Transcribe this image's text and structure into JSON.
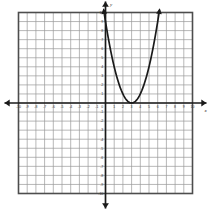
{
  "chart_data": {
    "type": "line",
    "title": "",
    "subtitle": "",
    "xlabel": "x",
    "ylabel": "y",
    "xlim": [
      -10,
      10
    ],
    "ylim": [
      -10,
      10
    ],
    "grid": true,
    "legend": "none",
    "x_ticks": [
      -10,
      -9,
      -8,
      -7,
      -6,
      -5,
      -4,
      -3,
      -2,
      -1,
      1,
      2,
      3,
      4,
      5,
      6,
      7,
      8,
      9,
      10
    ],
    "y_ticks": [
      10,
      9,
      8,
      7,
      6,
      5,
      4,
      3,
      2,
      1,
      -1,
      -2,
      -3,
      -4,
      -5,
      -6,
      -7,
      -8,
      -9,
      -10
    ],
    "x_tick_labels": [
      "-10",
      "-9",
      "-8",
      "-7",
      "-6",
      "-5",
      "-4",
      "-3",
      "-2",
      "-1",
      "1",
      "2",
      "3",
      "4",
      "5",
      "6",
      "7",
      "8",
      "9",
      "10"
    ],
    "y_tick_labels": [
      "10",
      "9",
      "8",
      "7",
      "6",
      "5",
      "4",
      "3",
      "2",
      "1",
      "-1",
      "-2",
      "-3",
      "-4",
      "-5",
      "-6",
      "-7",
      "-8",
      "-9",
      "-10"
    ],
    "origin_label": "0",
    "series": [
      {
        "name": "parabola",
        "equation": "y = (x - 3)^2",
        "vertex": [
          3,
          0
        ],
        "opens": "up",
        "color": "#1a1a1a",
        "x": [
          -0.2,
          0.0,
          0.5,
          1.0,
          1.5,
          2.0,
          2.5,
          3.0,
          3.5,
          4.0,
          4.5,
          5.0,
          5.5,
          6.0,
          6.2
        ],
        "values": [
          10.24,
          9.0,
          6.25,
          4.0,
          2.25,
          1.0,
          0.25,
          0.0,
          0.25,
          1.0,
          2.25,
          4.0,
          6.25,
          9.0,
          10.24
        ]
      }
    ],
    "annotations": [
      {
        "name": "y-axis-arrow-up",
        "at": [
          0,
          10.6
        ]
      },
      {
        "name": "y-axis-arrow-down",
        "at": [
          0,
          -11.2
        ]
      },
      {
        "name": "x-axis-arrow-right",
        "at": [
          11.2,
          0
        ]
      },
      {
        "name": "x-axis-arrow-left",
        "at": [
          -11.2,
          0
        ]
      },
      {
        "name": "curve-arrow-left-end",
        "at": [
          -0.2,
          10.4
        ]
      },
      {
        "name": "curve-arrow-right-end",
        "at": [
          6.2,
          10.4
        ]
      }
    ],
    "colors": {
      "grid": "#9a9a9a",
      "axis": "#1a1a1a",
      "curve": "#1a1a1a",
      "frame": "#4d4d4d",
      "background": "#ffffff",
      "tick_label": "#3a3a3a"
    }
  }
}
